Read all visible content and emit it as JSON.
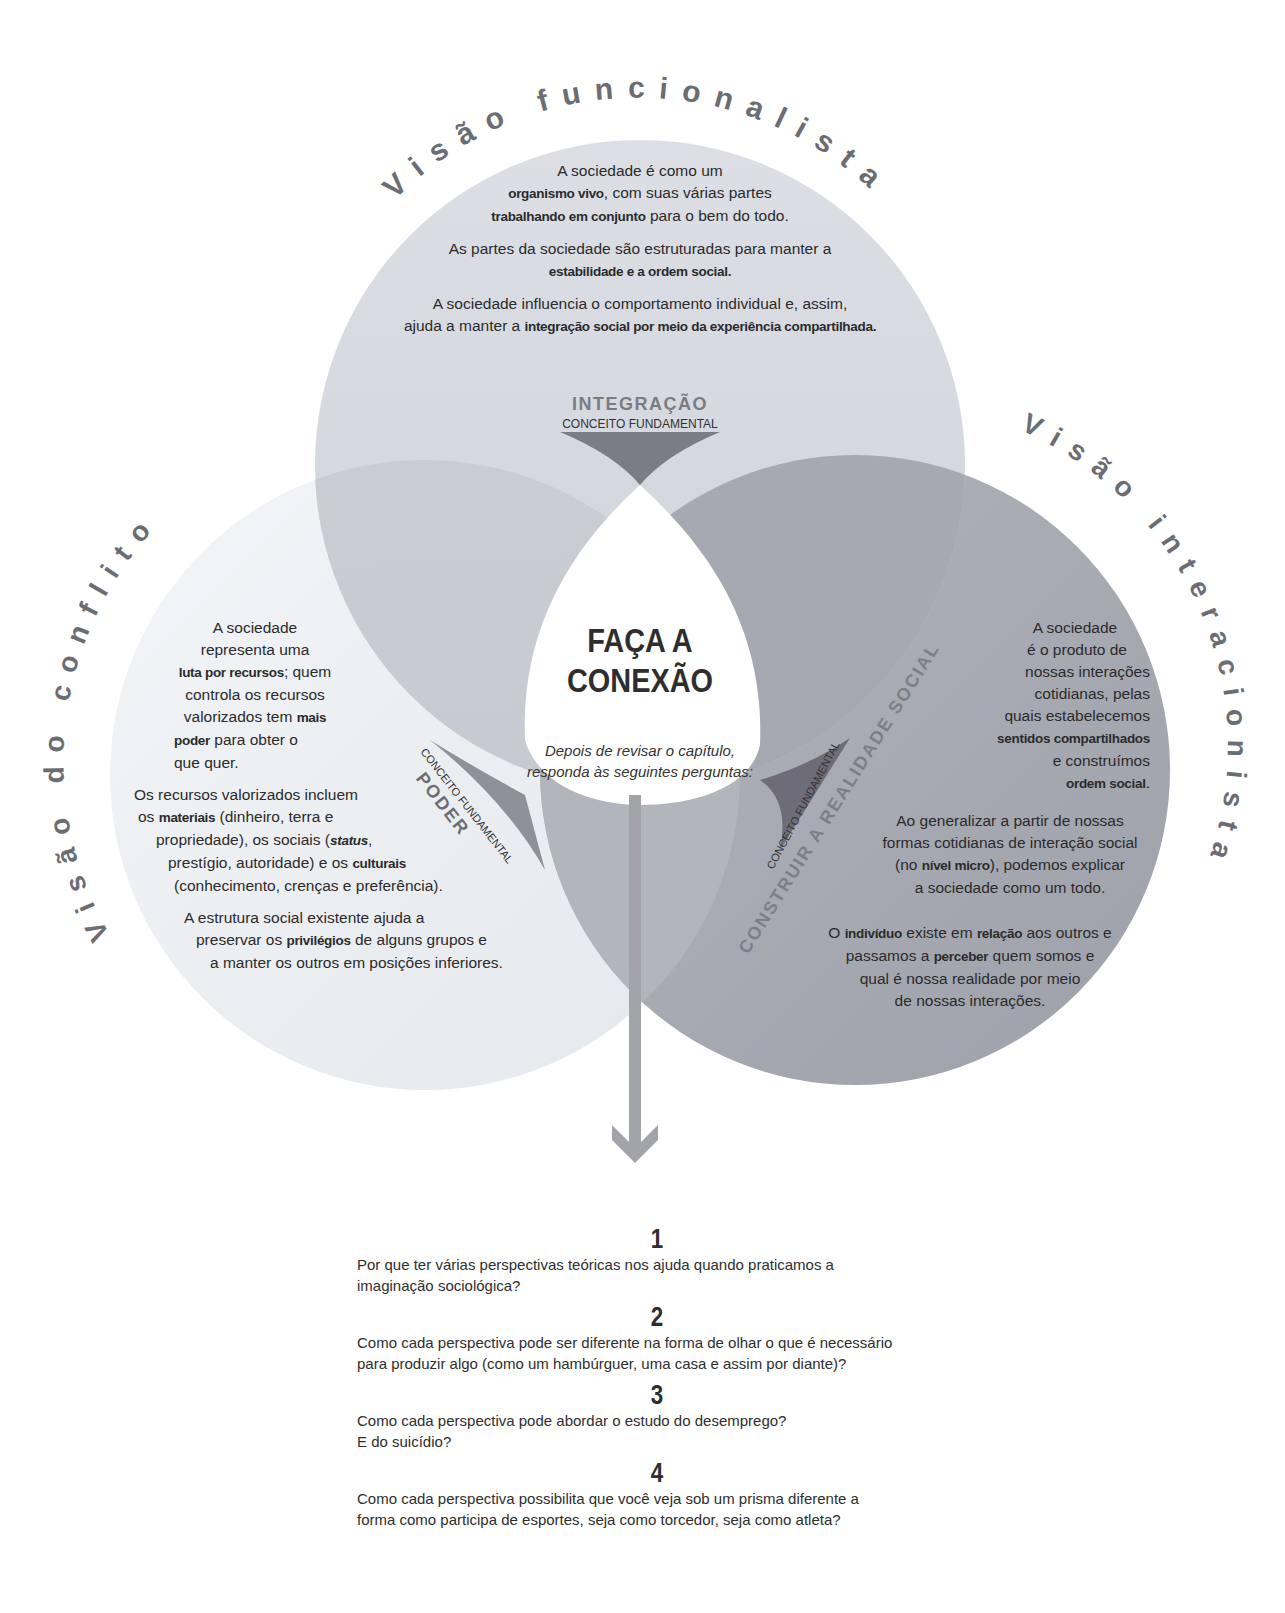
{
  "colors": {
    "top_circle": "#d2d4dc",
    "left_circle": "#eaedf1",
    "right_circle": "#a7aab2",
    "overlap_dark": "#7d8089",
    "arc_text": "#6b6d72",
    "arrow": "#a0a2a8",
    "text": "#2b2b2b"
  },
  "perspectives": {
    "functionalist": {
      "arc_title": "Visão funcionalista",
      "paragraphs": [
        {
          "parts": [
            [
              "A sociedade é como um",
              false
            ],
            [
              "organismo vivo",
              true
            ],
            [
              ", com suas várias partes",
              false
            ],
            [
              "trabalhando em conjunto",
              true
            ],
            [
              " para o bem do todo.",
              false
            ]
          ]
        },
        {
          "parts": [
            [
              "As partes da sociedade são estruturadas para manter a ",
              false
            ],
            [
              "estabilidade e a ordem social.",
              true
            ]
          ]
        },
        {
          "parts": [
            [
              "A sociedade influencia o comportamento individual e, assim, ajuda a manter a ",
              false
            ],
            [
              "integração social por meio da experiência compartilhada.",
              true
            ]
          ]
        }
      ],
      "line1": "A sociedade é como um",
      "line2_bold": "organismo vivo",
      "line2_rest": ", com suas várias partes",
      "line3_bold": "trabalhando em conjunto",
      "line3_rest": " para o bem do todo.",
      "p2_text": "As partes da sociedade são estruturadas para manter a",
      "p2_bold": "estabilidade e a ordem social.",
      "p3_text": "A sociedade influencia o comportamento individual e, assim,",
      "p3_text2": "ajuda a manter a ",
      "p3_bold": "integração social por meio da experiência compartilhada.",
      "concept_label": "CONCEITO FUNDAMENTAL",
      "concept": "INTEGRAÇÃO"
    },
    "conflict": {
      "arc_title": "Visão do conflito",
      "p1_a": "A sociedade",
      "p1_b": "representa uma",
      "p1_c_bold": "luta por recursos",
      "p1_c_rest": "; quem",
      "p1_d": "controla os recursos",
      "p1_e": "valorizados tem ",
      "p1_e_bold": "mais",
      "p1_f_bold": "poder",
      "p1_f_rest": " para obter o",
      "p1_g": "que quer.",
      "p2_a": "Os recursos valorizados incluem",
      "p2_b1": "os ",
      "p2_b_bold": "materiais",
      "p2_b2": " (dinheiro, terra e",
      "p2_c1": "propriedade), os sociais (",
      "p2_c_italic": "status",
      "p2_c2": ",",
      "p2_d1": "prestígio, autoridade) e os ",
      "p2_d_bold": "culturais",
      "p2_e": "(conhecimento, crenças e preferência).",
      "p3_a": "A estrutura social existente ajuda a",
      "p3_b1": "preservar os ",
      "p3_b_bold": "privilégios",
      "p3_b2": " de alguns grupos e",
      "p3_c": "a manter os outros em posições inferiores.",
      "concept_label": "CONCEITO FUNDAMENTAL",
      "concept": "PODER"
    },
    "interactionist": {
      "arc_title": "Visão interacionista",
      "p1_a": "A sociedade",
      "p1_b": "é o produto de",
      "p1_c": "nossas interações",
      "p1_d": "cotidianas, pelas",
      "p1_e": "quais estabelecemos",
      "p1_f_bold": "sentidos compartilhados",
      "p1_g": "e construímos",
      "p1_h_bold": "ordem social",
      "p1_h_rest": ".",
      "p2_a": "Ao generalizar a partir de nossas",
      "p2_b": "formas cotidianas de interação social",
      "p2_c1": "(no ",
      "p2_c_bold": "nível micro",
      "p2_c2": "), podemos explicar",
      "p2_d": "a sociedade como um todo.",
      "p3_a1": "O ",
      "p3_a_bold1": "indivíduo",
      "p3_a2": " existe em ",
      "p3_a_bold2": "relação",
      "p3_a3": " aos outros e",
      "p3_b1": "passamos a ",
      "p3_b_bold": "perceber",
      "p3_b2": " quem somos e",
      "p3_c": "qual é nossa realidade por meio",
      "p3_d": "de nossas interações.",
      "concept_label": "CONCEITO FUNDAMENTAL",
      "concept": "CONSTRUIR A REALIDADE SOCIAL"
    }
  },
  "center": {
    "title_line1": "FAÇA A",
    "title_line2": "CONEXÃO",
    "subtitle_line1": "Depois de revisar o capítulo,",
    "subtitle_line2": "responda às seguintes perguntas:"
  },
  "questions": [
    {
      "number": "1",
      "line1": "Por que ter várias perspectivas teóricas nos ajuda quando praticamos a",
      "line2": "imaginação sociológica?"
    },
    {
      "number": "2",
      "line1": "Como cada perspectiva pode ser diferente na forma de olhar o que é necessário",
      "line2": "para produzir algo (como um hambúrguer, uma casa e assim por diante)?"
    },
    {
      "number": "3",
      "line1": "Como cada perspectiva pode abordar o estudo do desemprego?",
      "line2": "E do suicídio?"
    },
    {
      "number": "4",
      "line1": "Como cada perspectiva possibilita que você veja sob um prisma diferente a",
      "line2": "forma como participa de esportes, seja como torcedor, seja como atleta?"
    }
  ]
}
